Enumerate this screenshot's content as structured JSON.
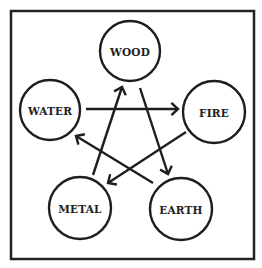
{
  "diagram": {
    "frame": {
      "x": 11,
      "y": 11,
      "width": 243,
      "height": 248,
      "color": "#222222"
    },
    "nodes": [
      {
        "id": "wood",
        "label": "WOOD",
        "cx": 130,
        "cy": 51,
        "r": 30
      },
      {
        "id": "fire",
        "label": "FIRE",
        "cx": 214,
        "cy": 112,
        "r": 31
      },
      {
        "id": "earth",
        "label": "EARTH",
        "cx": 181,
        "cy": 209,
        "r": 31
      },
      {
        "id": "metal",
        "label": "METAL",
        "cx": 80,
        "cy": 208,
        "r": 31
      },
      {
        "id": "water",
        "label": "WATER",
        "cx": 50,
        "cy": 110,
        "r": 30
      }
    ],
    "edges": [
      {
        "from": "water",
        "to": "fire",
        "x1": 86,
        "y1": 109,
        "x2": 178,
        "y2": 109
      },
      {
        "from": "wood",
        "to": "earth",
        "x1": 140,
        "y1": 88,
        "x2": 168,
        "y2": 174
      },
      {
        "from": "fire",
        "to": "metal",
        "x1": 186,
        "y1": 132,
        "x2": 108,
        "y2": 183
      },
      {
        "from": "earth",
        "to": "water",
        "x1": 153,
        "y1": 183,
        "x2": 76,
        "y2": 136
      },
      {
        "from": "metal",
        "to": "wood",
        "x1": 93,
        "y1": 175,
        "x2": 122,
        "y2": 87
      }
    ],
    "colors": {
      "stroke": "#1e1e1e",
      "text": "#222222",
      "background": "#ffffff"
    }
  }
}
